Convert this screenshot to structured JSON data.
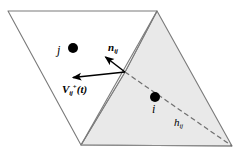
{
  "figure": {
    "canvas": {
      "width": 239,
      "height": 158
    },
    "colors": {
      "background": "#ffffff",
      "outline": "#7a7a7a",
      "shaded_fill": "#e9e9e9",
      "unshaded_fill": "#ffffff",
      "ink": "#000000",
      "dashed": "#6f6f6f"
    },
    "regions": [
      {
        "name": "left-cell",
        "shading": "unshaded",
        "points": "8,11 157,11 125,72 81,145"
      },
      {
        "name": "right-cell",
        "shading": "shaded",
        "points": "157,11 232,146 81,145 125,72"
      }
    ],
    "interface_edge": {
      "from": [
        157,
        11
      ],
      "to": [
        81,
        145
      ]
    },
    "dashed_line": {
      "name": "branch-vector",
      "from": [
        125,
        72
      ],
      "to": [
        232,
        146
      ],
      "dash": "5 3"
    },
    "contact_point": [
      125,
      72
    ],
    "particles": [
      {
        "id": "j",
        "label": "j",
        "center": [
          73,
          48
        ],
        "radius": 5.0,
        "label_side": "left"
      },
      {
        "id": "i",
        "label": "i",
        "center": [
          155,
          97
        ],
        "radius": 5.0,
        "label_side": "below"
      }
    ],
    "vectors": [
      {
        "name": "normal-vector",
        "symbol": "n",
        "subscript": "ij",
        "superscript": "",
        "from": [
          125,
          72
        ],
        "to": [
          103,
          55
        ],
        "arrowhead": "to"
      },
      {
        "name": "relative-velocity-vector",
        "symbol": "V",
        "subscript": "ij",
        "superscript": "+",
        "suffix": "(t)",
        "from": [
          125,
          72
        ],
        "to": [
          70,
          78
        ],
        "arrowhead": "to"
      }
    ],
    "labels": {
      "j": "j",
      "i": "i",
      "n_symbol": "n",
      "n_sub": "ij",
      "v_symbol": "V",
      "v_sub": "ij",
      "v_sup": "+",
      "v_suffix": "(t)",
      "h_symbol": "h",
      "h_sub": "ij"
    }
  }
}
